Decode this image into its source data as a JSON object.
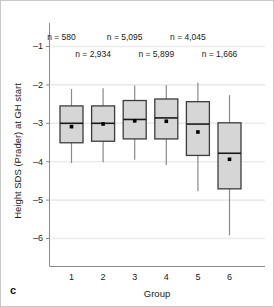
{
  "panel": {
    "label": "c"
  },
  "chart_data": {
    "type": "box",
    "title": "",
    "xlabel": "Group",
    "ylabel": "Height SDS (Prader) at GH start",
    "categories": [
      "1",
      "2",
      "3",
      "4",
      "5",
      "6"
    ],
    "ylim": [
      -6.6,
      -0.6
    ],
    "yticks": [
      -1,
      -2,
      -3,
      -4,
      -5,
      -6
    ],
    "ytick_labels": [
      "–1",
      "–2",
      "–3",
      "–4",
      "–5",
      "–6"
    ],
    "grid": "horizontal",
    "legend": "none",
    "box_fill": "#d6d6d6",
    "box_stroke": "#3c3c3c",
    "median_color": "#1a1a1a",
    "whisker_color": "#8a8a8a",
    "mean_marker_color": "#000000",
    "grid_color": "#ebebeb",
    "axis_color": "#8a8a8a",
    "boxes": [
      {
        "group": "1",
        "n_label": "n = 580",
        "whisker_low": -4.05,
        "q1": -3.52,
        "median": -3.0,
        "q3": -2.56,
        "whisker_high": -2.12,
        "mean": -3.1
      },
      {
        "group": "2",
        "n_label": "n = 2,934",
        "whisker_low": -4.03,
        "q1": -3.48,
        "median": -3.0,
        "q3": -2.56,
        "whisker_high": -2.1,
        "mean": -3.03
      },
      {
        "group": "3",
        "n_label": "n = 5,095",
        "whisker_low": -3.96,
        "q1": -3.42,
        "median": -2.9,
        "q3": -2.42,
        "whisker_high": -2.03,
        "mean": -2.95
      },
      {
        "group": "4",
        "n_label": "n = 5,899",
        "whisker_low": -4.1,
        "q1": -3.42,
        "median": -2.86,
        "q3": -2.38,
        "whisker_high": -2.02,
        "mean": -2.96
      },
      {
        "group": "5",
        "n_label": "n = 4,045",
        "whisker_low": -4.78,
        "q1": -3.85,
        "median": -3.02,
        "q3": -2.45,
        "whisker_high": -1.95,
        "mean": -3.24
      },
      {
        "group": "6",
        "n_label": "n = 1,666",
        "whisker_low": -5.93,
        "q1": -4.72,
        "median": -3.78,
        "q3": -3.0,
        "whisker_high": -2.28,
        "mean": -3.95
      }
    ],
    "n_annotations_row1": [
      "n = 580",
      "n = 5,095",
      "n = 4,045"
    ],
    "n_annotations_row2": [
      "n = 2,934",
      "n = 5,899",
      "n = 1,666"
    ]
  }
}
